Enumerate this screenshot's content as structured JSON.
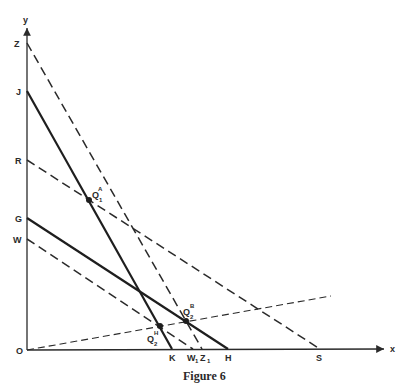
{
  "figure": {
    "caption": "Figure 6",
    "axes": {
      "x_label": "x",
      "y_label": "y",
      "origin_label": "O"
    },
    "y_intercepts": [
      "Z",
      "J",
      "R",
      "G",
      "W"
    ],
    "x_intercepts": [
      "K",
      "W1",
      "Z1",
      "H",
      "S"
    ],
    "lines": [
      {
        "name": "ZZ1",
        "from": "Z",
        "to": "Z1",
        "style": "dashed"
      },
      {
        "name": "JK",
        "from": "J",
        "to": "K",
        "style": "solid"
      },
      {
        "name": "RS",
        "from": "R",
        "to": "S",
        "style": "dashed"
      },
      {
        "name": "GH",
        "from": "G",
        "to": "H",
        "style": "solid"
      },
      {
        "name": "WW1",
        "from": "W",
        "to": "W1",
        "style": "dashed"
      },
      {
        "name": "ray-from-origin",
        "from": "O",
        "to": "",
        "style": "dashed"
      }
    ],
    "points": [
      {
        "id": "Q1A",
        "base": "Q",
        "sub": "1",
        "sup": "A"
      },
      {
        "id": "Q2H",
        "base": "Q",
        "sub": "2",
        "sup": "H"
      },
      {
        "id": "Q2B",
        "base": "Q",
        "sub": "2",
        "sup": "B"
      }
    ],
    "labels": {
      "Z": "Z",
      "J": "J",
      "R": "R",
      "G": "G",
      "W": "W",
      "K": "K",
      "W1_base": "W",
      "W1_sub": "1",
      "Z1_base": "Z",
      "Z1_sub": "1",
      "H": "H",
      "S": "S",
      "Q": "Q",
      "one": "1",
      "two": "2",
      "A": "A",
      "H_sup": "H",
      "B": "B"
    }
  }
}
